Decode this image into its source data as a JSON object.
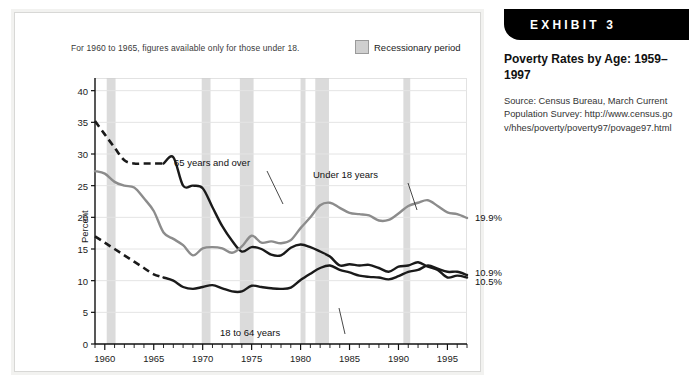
{
  "exhibit": {
    "tab_label": "EXHIBIT 3",
    "title": "Poverty Rates by Age: 1959–1997",
    "source": "Source: Census Bureau, March Current Population Survey: http://www.census.gov/hhes/poverty/poverty97/povage97.html"
  },
  "chart_note": "For 1960 to 1965, figures available only for those under 18.",
  "legend": {
    "recession_label": "Recessionary period",
    "recession_color": "#cfcfcf"
  },
  "annotations": {
    "over65": "65 years and over",
    "under18": "Under 18 years",
    "adults": "18 to 64 years"
  },
  "end_labels": {
    "under18": "19.9%",
    "adults": "10.9%",
    "over65": "10.5%"
  },
  "chart_data": {
    "type": "line",
    "xlabel": "",
    "ylabel": "Percent",
    "xlim": [
      1959,
      1997
    ],
    "ylim": [
      0,
      42
    ],
    "yticks": [
      0,
      5,
      10,
      15,
      20,
      25,
      30,
      35,
      40
    ],
    "ytick_labels": [
      "0",
      "5",
      "10",
      "15",
      "20",
      "25",
      "30",
      "35",
      "40"
    ],
    "xticks": [
      1960,
      1965,
      1970,
      1975,
      1980,
      1985,
      1990,
      1995
    ],
    "xtick_labels": [
      "1960",
      "1965",
      "1970",
      "1975",
      "1980",
      "1985",
      "1990",
      "1995"
    ],
    "minor_xticks_every": 1,
    "grid": "horizontal",
    "legend_position": "top-right",
    "x": [
      1959,
      1960,
      1961,
      1962,
      1963,
      1964,
      1965,
      1966,
      1967,
      1968,
      1969,
      1970,
      1971,
      1972,
      1973,
      1974,
      1975,
      1976,
      1977,
      1978,
      1979,
      1980,
      1981,
      1982,
      1983,
      1984,
      1985,
      1986,
      1987,
      1988,
      1989,
      1990,
      1991,
      1992,
      1993,
      1994,
      1995,
      1996,
      1997
    ],
    "series": [
      {
        "name": "65 years and over",
        "color": "#1a1a1a",
        "dashed_through": 1966,
        "dash_note": "1959-1966 interpolated (dashed)",
        "values": [
          35.2,
          33.1,
          31.0,
          29.0,
          28.5,
          28.5,
          28.5,
          28.5,
          29.5,
          25.0,
          25.0,
          24.6,
          21.6,
          18.6,
          16.3,
          14.6,
          15.3,
          15.0,
          14.1,
          14.0,
          15.2,
          15.7,
          15.3,
          14.6,
          13.8,
          12.4,
          12.6,
          12.4,
          12.5,
          12.0,
          11.4,
          12.2,
          12.4,
          12.9,
          12.2,
          11.7,
          10.5,
          10.8,
          10.5
        ]
      },
      {
        "name": "Under 18 years",
        "color": "#8c8c8c",
        "dashed_through": null,
        "values": [
          27.3,
          26.9,
          25.6,
          25.0,
          24.7,
          23.0,
          21.0,
          17.6,
          16.6,
          15.6,
          14.0,
          15.1,
          15.3,
          15.1,
          14.4,
          15.4,
          17.1,
          16.0,
          16.2,
          15.9,
          16.4,
          18.3,
          20.0,
          21.9,
          22.3,
          21.5,
          20.7,
          20.5,
          20.3,
          19.5,
          19.6,
          20.6,
          21.8,
          22.3,
          22.7,
          21.8,
          20.8,
          20.5,
          19.9
        ]
      },
      {
        "name": "18 to 64 years",
        "color": "#1a1a1a",
        "dashed_through": 1966,
        "dash_note": "1959-1966 interpolated (dashed)",
        "values": [
          17.0,
          16.0,
          15.0,
          14.0,
          13.0,
          12.0,
          11.0,
          10.5,
          10.0,
          9.0,
          8.7,
          9.0,
          9.3,
          8.8,
          8.3,
          8.3,
          9.2,
          9.0,
          8.8,
          8.7,
          8.9,
          10.1,
          11.1,
          12.0,
          12.4,
          11.7,
          11.3,
          10.8,
          10.6,
          10.5,
          10.2,
          10.7,
          11.4,
          11.7,
          12.4,
          11.9,
          11.4,
          11.4,
          10.9
        ]
      }
    ],
    "recession_bands": [
      {
        "start": 1960.2,
        "end": 1961.1
      },
      {
        "start": 1969.9,
        "end": 1970.8
      },
      {
        "start": 1973.8,
        "end": 1975.2
      },
      {
        "start": 1980.0,
        "end": 1980.5
      },
      {
        "start": 1981.5,
        "end": 1982.9
      },
      {
        "start": 1990.5,
        "end": 1991.2
      }
    ]
  }
}
